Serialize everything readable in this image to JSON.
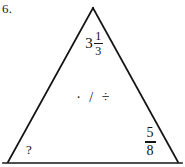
{
  "problem": {
    "number_label": "6.",
    "figure": "triangle",
    "stroke_color": "#141414",
    "background_color": "#ffffff"
  },
  "triangle": {
    "apex_value": {
      "kind": "mixed-number",
      "whole": "3",
      "numerator": "1",
      "denominator": "3",
      "plain_text": "3 1/3"
    },
    "center_operators": {
      "symbols": "· / ÷",
      "plain_text": "multiply / divide"
    },
    "bottom_right_value": {
      "kind": "fraction",
      "numerator": "5",
      "denominator": "8",
      "plain_text": "5/8"
    },
    "bottom_left_value": {
      "kind": "unknown",
      "text": "?"
    }
  }
}
